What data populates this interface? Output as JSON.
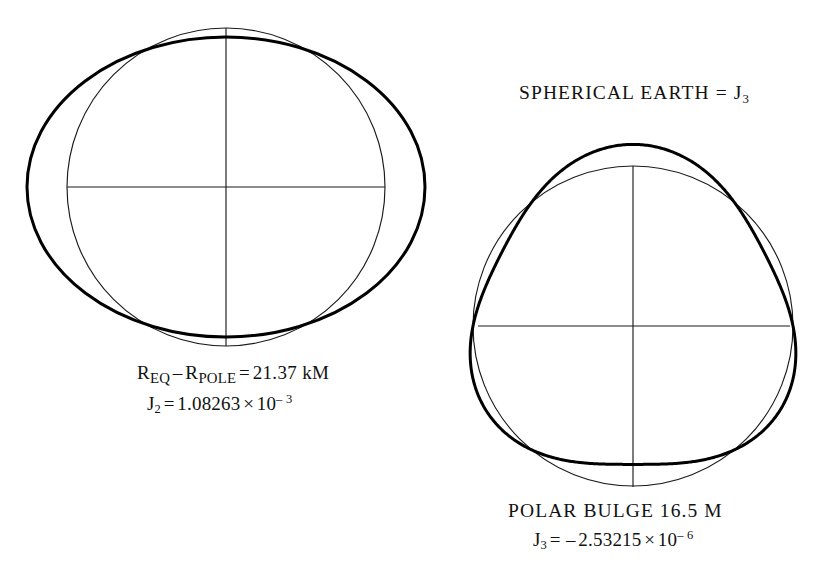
{
  "figure": {
    "background_color": "#ffffff",
    "ink_color": "#111111",
    "thick_stroke_color": "#000000",
    "thin_stroke_color": "#1b1b1b",
    "thick_stroke_width": 3.0,
    "thin_stroke_width": 1.15
  },
  "title": {
    "text": "SPHERICAL EARTH  =  J",
    "subscript": "3",
    "full_text": "SPHERICAL EARTH = J3",
    "x": 519,
    "y": 82
  },
  "left_diagram": {
    "name": "oblate-spheroid-j2",
    "center_x": 226,
    "center_y": 187,
    "sphere_radius": 159,
    "ellipse_semi_major_x": 199,
    "ellipse_semi_minor_y": 150,
    "axis_horizontal": {
      "x1": 67,
      "x2": 385,
      "y": 187
    },
    "axis_vertical": {
      "y1": 28,
      "y2": 346,
      "x": 226
    },
    "caption": {
      "line1": {
        "r_symbol_a": "R",
        "sub_a": "EQ",
        "minus": "–",
        "r_symbol_b": "R",
        "sub_b": "POLE",
        "equals": "=",
        "value": "21.37 kM",
        "full_text": "REQ – RPOLE = 21.37 kM",
        "x": 137,
        "y": 362
      },
      "line2": {
        "j_symbol": "J",
        "sub": "2",
        "equals": "=",
        "mantissa": "1.08263",
        "times": "×",
        "base": "10",
        "exponent": "– 3",
        "full_text": "J2 = 1.08263 × 10–3",
        "x": 147,
        "y": 392
      }
    }
  },
  "right_diagram": {
    "name": "pear-shaped-earth-j3",
    "center_x": 633,
    "center_y": 326,
    "sphere_radius": 160,
    "harmonic_amplitude": 0.135,
    "harmonic_degree": 3,
    "north_pole_y": 124,
    "south_pole_y": 456,
    "axis_horizontal": {
      "x1": 478,
      "x2": 790,
      "y": 326
    },
    "axis_vertical": {
      "y1": 166,
      "y2": 487,
      "x": 633
    },
    "caption": {
      "line1": {
        "text": "POLAR BULGE 16.5 M",
        "x": 508,
        "y": 500
      },
      "line2": {
        "j_symbol": "J",
        "sub": "3",
        "equals": "=",
        "sign": "–",
        "mantissa": "2.53215",
        "times": "×",
        "base": "10",
        "exponent": "– 6",
        "full_text": "J3 = – 2.53215 × 10–6",
        "x": 533,
        "y": 528
      }
    }
  }
}
